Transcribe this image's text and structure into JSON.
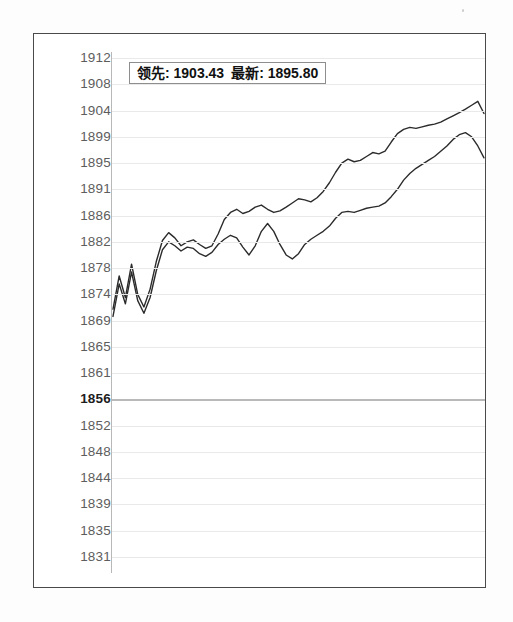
{
  "readout": {
    "leading_label": "领先: 1903.43",
    "latest_label": "最新: 1895.80"
  },
  "chart_data": {
    "type": "line",
    "title": "",
    "xlabel": "",
    "ylabel": "",
    "grid": true,
    "legend_position": "top-overlay",
    "ylim": [
      1829,
      1914
    ],
    "ytick_labels": [
      "1912",
      "1908",
      "1904",
      "1899",
      "1895",
      "1891",
      "1886",
      "1882",
      "1878",
      "1874",
      "1869",
      "1865",
      "1861",
      "1856",
      "1852",
      "1848",
      "1844",
      "1839",
      "1835",
      "1831"
    ],
    "ytick_values": [
      1912,
      1908,
      1904,
      1899,
      1895,
      1891,
      1886,
      1882,
      1878,
      1874,
      1869,
      1865,
      1861,
      1856,
      1852,
      1848,
      1844,
      1839,
      1835,
      1831
    ],
    "reference_line": {
      "value": 1856,
      "label": "1856",
      "emphasis": "bold"
    },
    "series": [
      {
        "name": "领先",
        "final_value": 1903.43,
        "color": "#2b2b2b",
        "x": [
          0,
          1,
          2,
          3,
          4,
          5,
          6,
          7,
          8,
          9,
          10,
          11,
          12,
          13,
          14,
          15,
          16,
          17,
          18,
          19,
          20,
          21,
          22,
          23,
          24,
          25,
          26,
          27,
          28,
          29,
          30,
          31,
          32,
          33,
          34,
          35,
          36,
          37,
          38,
          39,
          40,
          41,
          42,
          43,
          44,
          45,
          46,
          47,
          48,
          49,
          50,
          51,
          52,
          53,
          54,
          55,
          56,
          57,
          58,
          59,
          60
        ],
        "values": [
          1871.2,
          1876.8,
          1873.4,
          1878.6,
          1874.0,
          1871.6,
          1874.8,
          1879.0,
          1882.2,
          1883.4,
          1882.6,
          1881.4,
          1882.0,
          1882.3,
          1881.6,
          1881.0,
          1881.4,
          1883.2,
          1885.4,
          1886.6,
          1887.2,
          1886.4,
          1886.8,
          1887.6,
          1888.0,
          1887.2,
          1886.6,
          1886.9,
          1887.6,
          1888.4,
          1889.2,
          1889.0,
          1888.6,
          1889.4,
          1890.6,
          1892.0,
          1893.6,
          1895.0,
          1895.6,
          1895.2,
          1895.4,
          1896.0,
          1896.6,
          1896.4,
          1896.8,
          1898.2,
          1899.6,
          1900.4,
          1900.8,
          1900.6,
          1900.9,
          1901.2,
          1901.4,
          1901.8,
          1902.4,
          1903.0,
          1903.6,
          1904.2,
          1904.8,
          1905.4,
          1903.43
        ]
      },
      {
        "name": "最新",
        "final_value": 1895.8,
        "color": "#2b2b2b",
        "x": [
          0,
          1,
          2,
          3,
          4,
          5,
          6,
          7,
          8,
          9,
          10,
          11,
          12,
          13,
          14,
          15,
          16,
          17,
          18,
          19,
          20,
          21,
          22,
          23,
          24,
          25,
          26,
          27,
          28,
          29,
          30,
          31,
          32,
          33,
          34,
          35,
          36,
          37,
          38,
          39,
          40,
          41,
          42,
          43,
          44,
          45,
          46,
          47,
          48,
          49,
          50,
          51,
          52,
          53,
          54,
          55,
          56,
          57,
          58,
          59,
          60
        ],
        "values": [
          1869.8,
          1875.6,
          1872.2,
          1877.4,
          1872.8,
          1870.4,
          1873.4,
          1877.6,
          1880.8,
          1882.0,
          1881.4,
          1880.6,
          1881.2,
          1881.0,
          1880.2,
          1879.8,
          1880.4,
          1881.6,
          1882.4,
          1883.0,
          1882.6,
          1881.2,
          1880.0,
          1881.4,
          1883.6,
          1884.8,
          1883.6,
          1881.6,
          1880.0,
          1879.4,
          1880.2,
          1881.6,
          1882.4,
          1883.0,
          1883.6,
          1884.4,
          1885.6,
          1886.6,
          1886.8,
          1886.6,
          1887.0,
          1887.4,
          1887.6,
          1887.8,
          1888.4,
          1889.6,
          1891.0,
          1892.4,
          1893.4,
          1894.2,
          1894.8,
          1895.4,
          1896.0,
          1896.8,
          1897.6,
          1898.6,
          1899.4,
          1899.8,
          1899.0,
          1897.6,
          1895.8
        ]
      }
    ]
  }
}
